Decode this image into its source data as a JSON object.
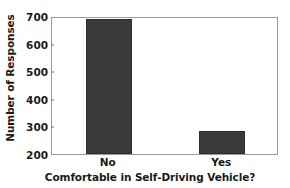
{
  "chart_data": {
    "type": "bar",
    "title": "",
    "subtitle": "",
    "xlabel": "Comfortable in Self-Driving Vehicle?",
    "ylabel": "Number of Responses",
    "categories": [
      "No",
      "Yes"
    ],
    "values": [
      688,
      285
    ],
    "series": [
      {
        "name": "Number of Responses",
        "values": [
          688,
          285
        ]
      }
    ],
    "ylim": [
      200,
      700
    ],
    "yticks": [
      200,
      300,
      400,
      500,
      600,
      700
    ],
    "ytick_labels": [
      "200",
      "300",
      "400",
      "500",
      "600",
      "700"
    ],
    "xtick_labels": [
      "No",
      "Yes"
    ],
    "grid": false,
    "legend": false,
    "legend_position": "none",
    "annotations": [],
    "bar_color": "#3a3a3a",
    "frame_color": "#9a9a9a",
    "background_color": "#ffffff",
    "text_color": "#1a1a1a"
  }
}
